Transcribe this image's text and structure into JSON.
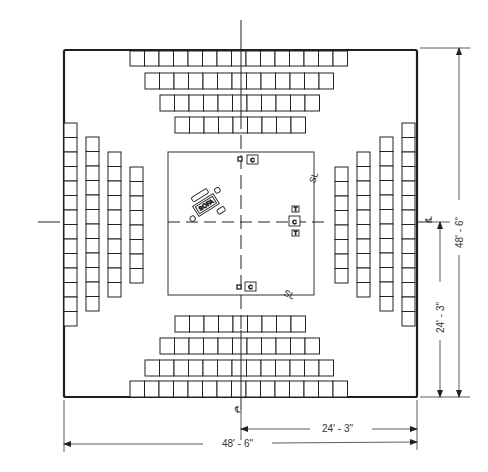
{
  "drawing": {
    "type": "floor-plan",
    "subject": "arena theatre seating plan",
    "stage_outline": {
      "x": 168,
      "y": 152,
      "w": 146,
      "h": 143
    },
    "room_outline": {
      "x": 64,
      "y": 50,
      "w": 353,
      "h": 347
    },
    "centerline_x": 241,
    "centerline_y": 222
  },
  "seating": {
    "top_rows": [
      {
        "seats": 15,
        "x": 130,
        "y": 50
      },
      {
        "seats": 13,
        "x": 145,
        "y": 73
      },
      {
        "seats": 11,
        "x": 160,
        "y": 95
      },
      {
        "seats": 9,
        "x": 175,
        "y": 117
      }
    ],
    "bottom_rows": [
      {
        "seats": 9,
        "x": 175,
        "y": 316
      },
      {
        "seats": 11,
        "x": 160,
        "y": 338
      },
      {
        "seats": 13,
        "x": 145,
        "y": 360
      },
      {
        "seats": 15,
        "x": 130,
        "y": 381
      }
    ],
    "left_columns": [
      {
        "seats": 14,
        "x": 64,
        "y": 123
      },
      {
        "seats": 12,
        "x": 86,
        "y": 137
      },
      {
        "seats": 10,
        "x": 108,
        "y": 152
      },
      {
        "seats": 8,
        "x": 130,
        "y": 167
      }
    ],
    "right_columns": [
      {
        "seats": 8,
        "x": 335,
        "y": 167
      },
      {
        "seats": 10,
        "x": 357,
        "y": 152
      },
      {
        "seats": 12,
        "x": 380,
        "y": 137
      },
      {
        "seats": 14,
        "x": 402,
        "y": 123
      }
    ],
    "seat_size": 14.5
  },
  "stage_furniture": {
    "sofa_label": "SOFA",
    "chair_label": "C",
    "table_label": "T",
    "chairs": [
      {
        "label": "C",
        "x": 247,
        "y": 155
      },
      {
        "label": "C",
        "x": 289,
        "y": 216
      },
      {
        "label": "C",
        "x": 245,
        "y": 282
      }
    ],
    "tables": [
      {
        "label": "T",
        "x": 292,
        "y": 206
      },
      {
        "label": "T",
        "x": 292,
        "y": 230
      }
    ]
  },
  "annotations": {
    "centerline_symbol": "℄",
    "right_centerline_symbol": "℄",
    "bottom_centerline_symbol": "℄",
    "stage_corner_marks": [
      "SL",
      "SL"
    ]
  },
  "dimensions": {
    "overall_width": "48' - 6\"",
    "half_width": "24' - 3\"",
    "overall_depth": "48' - 6\"",
    "half_depth": "24' - 3\""
  },
  "colors": {
    "line": "#1e1e1e",
    "light_line": "#555555",
    "paper": "#ffffff"
  }
}
